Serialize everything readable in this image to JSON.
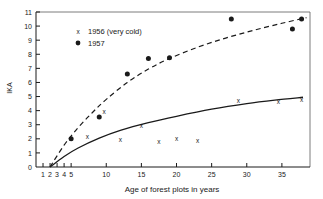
{
  "chart_data": {
    "type": "scatter",
    "title": "",
    "xlabel": "Age of forest plots in years",
    "ylabel": "IKA",
    "xlim": [
      0,
      39
    ],
    "ylim": [
      0,
      11
    ],
    "grid": false,
    "legend_position": "top-left",
    "xticks": [
      1,
      2,
      3,
      4,
      5,
      10,
      15,
      20,
      25,
      30,
      35
    ],
    "xticklabels": [
      "1",
      "2",
      "3",
      "4",
      "5",
      "10",
      "15",
      "20",
      "25",
      "30",
      "35"
    ],
    "yticks": [
      0,
      1,
      2,
      3,
      4,
      5,
      6,
      7,
      8,
      9,
      10,
      11
    ],
    "yticklabels": [
      "0",
      "1",
      "2",
      "3",
      "4",
      "5",
      "6",
      "7",
      "8",
      "9",
      "10",
      "11"
    ],
    "series": [
      {
        "name": "1956 (very cold)",
        "marker": "x",
        "linestyle": "solid",
        "points": [
          {
            "x": 7.3,
            "y": 2.15
          },
          {
            "x": 9.7,
            "y": 3.95
          },
          {
            "x": 12.0,
            "y": 1.95
          },
          {
            "x": 15.0,
            "y": 2.95
          },
          {
            "x": 17.5,
            "y": 1.8
          },
          {
            "x": 20.0,
            "y": 2.0
          },
          {
            "x": 23.0,
            "y": 1.85
          },
          {
            "x": 28.8,
            "y": 4.7
          },
          {
            "x": 34.5,
            "y": 4.65
          },
          {
            "x": 37.8,
            "y": 4.8
          }
        ],
        "curve": [
          {
            "x": 2.0,
            "y": 0.0
          },
          {
            "x": 4.0,
            "y": 0.75
          },
          {
            "x": 6.0,
            "y": 1.35
          },
          {
            "x": 9.0,
            "y": 2.05
          },
          {
            "x": 12.0,
            "y": 2.6
          },
          {
            "x": 16.0,
            "y": 3.15
          },
          {
            "x": 20.0,
            "y": 3.6
          },
          {
            "x": 25.0,
            "y": 4.1
          },
          {
            "x": 30.0,
            "y": 4.5
          },
          {
            "x": 34.0,
            "y": 4.75
          },
          {
            "x": 38.0,
            "y": 4.95
          }
        ]
      },
      {
        "name": "1957",
        "marker": "circle",
        "linestyle": "dashed",
        "points": [
          {
            "x": 5.0,
            "y": 2.0
          },
          {
            "x": 9.0,
            "y": 3.55
          },
          {
            "x": 13.0,
            "y": 6.6
          },
          {
            "x": 16.0,
            "y": 7.7
          },
          {
            "x": 19.0,
            "y": 7.75
          },
          {
            "x": 27.8,
            "y": 10.5
          },
          {
            "x": 36.5,
            "y": 9.8
          },
          {
            "x": 37.8,
            "y": 10.5
          }
        ],
        "curve": [
          {
            "x": 2.0,
            "y": 0.0
          },
          {
            "x": 4.0,
            "y": 1.55
          },
          {
            "x": 6.0,
            "y": 2.8
          },
          {
            "x": 8.0,
            "y": 3.85
          },
          {
            "x": 10.0,
            "y": 4.8
          },
          {
            "x": 13.0,
            "y": 6.0
          },
          {
            "x": 16.0,
            "y": 6.95
          },
          {
            "x": 19.0,
            "y": 7.7
          },
          {
            "x": 23.0,
            "y": 8.5
          },
          {
            "x": 27.0,
            "y": 9.15
          },
          {
            "x": 31.0,
            "y": 9.7
          },
          {
            "x": 35.0,
            "y": 10.2
          },
          {
            "x": 38.5,
            "y": 10.6
          }
        ]
      }
    ]
  },
  "legend": {
    "entries": [
      {
        "marker_glyph": "x",
        "label": "1956 (very cold)"
      },
      {
        "marker_glyph": "●",
        "label": "1957"
      }
    ]
  },
  "axis": {
    "y_label": "IKA",
    "x_label": "Age of forest plots in years"
  },
  "colors": {
    "ink": "#1a1a1a",
    "background": "#ffffff"
  }
}
